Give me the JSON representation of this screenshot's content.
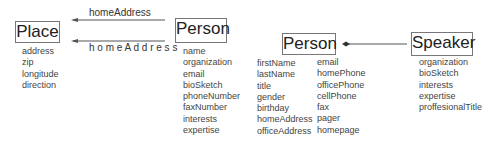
{
  "diagram": {
    "left": {
      "place": {
        "title": "Place",
        "attributes": [
          "address",
          "zip",
          "longitude",
          "direction"
        ]
      },
      "person": {
        "title": "Person",
        "attributes": [
          "name",
          "organization",
          "email",
          "bioSketch",
          "phoneNumber",
          "faxNumber",
          "interests",
          "expertise"
        ]
      },
      "edges": [
        {
          "label": "homeAddress",
          "from": "Person",
          "to": "Place",
          "style": "normal"
        },
        {
          "label": "h o m e A d d r e s s",
          "from": "Person",
          "to": "Place",
          "style": "spaced"
        }
      ]
    },
    "right": {
      "person": {
        "title": "Person",
        "attributes_col1": [
          "firstName",
          "lastName",
          "title",
          "gender",
          "birthday",
          "homeAddress",
          "officeAddress"
        ],
        "attributes_col2": [
          "email",
          "homePhone",
          "officePhone",
          "cellPhone",
          "fax",
          "pager",
          "homepage"
        ]
      },
      "speaker": {
        "title": "Speaker",
        "attributes": [
          "organization",
          "bioSketch",
          "interests",
          "expertise",
          "proffesionalTitle"
        ]
      },
      "edge": {
        "from": "Speaker",
        "to": "Person",
        "marker": "diamond"
      }
    },
    "colors": {
      "line": "#555555",
      "box_border": "#777777",
      "text": "#333333"
    }
  }
}
